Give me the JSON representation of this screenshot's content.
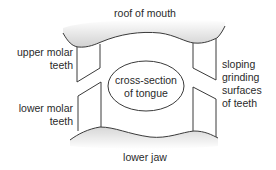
{
  "diagram": {
    "type": "anatomical cross-section",
    "labels": {
      "roof_of_mouth": "roof of mouth",
      "upper_molar_line1": "upper molar",
      "upper_molar_line2": "teeth",
      "lower_molar_line1": "lower molar",
      "lower_molar_line2": "teeth",
      "tongue_line1": "cross-section",
      "tongue_line2": "of tongue",
      "sloping_line1": "sloping",
      "sloping_line2": "grinding",
      "sloping_line3": "surfaces",
      "sloping_line4": "of teeth",
      "lower_jaw": "lower jaw"
    },
    "colors": {
      "stroke": "#3a3a3a",
      "shading": "#c8c8c8",
      "text": "#2a2a2a",
      "background": "#ffffff"
    }
  }
}
